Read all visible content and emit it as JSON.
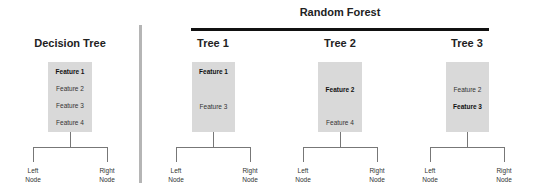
{
  "random_forest": {
    "title": "Random Forest"
  },
  "trees": [
    {
      "title": "Decision Tree",
      "features": [
        {
          "label": "Feature 1",
          "bold": true
        },
        {
          "label": "Feature 2",
          "bold": false
        },
        {
          "label": "Feature 3",
          "bold": false
        },
        {
          "label": "Feature 4",
          "bold": false
        }
      ],
      "left_node": [
        "Left",
        "Node"
      ],
      "right_node": [
        "Right",
        "Node"
      ]
    },
    {
      "title": "Tree 1",
      "features": [
        {
          "label": "Feature 1",
          "bold": true
        },
        {
          "label": "Feature 3",
          "bold": false
        }
      ],
      "left_node": [
        "Left",
        "Node"
      ],
      "right_node": [
        "Right",
        "Node"
      ]
    },
    {
      "title": "Tree 2",
      "features": [
        {
          "label": "Feature 2",
          "bold": true
        },
        {
          "label": "Feature 4",
          "bold": false
        }
      ],
      "left_node": [
        "Left",
        "Node"
      ],
      "right_node": [
        "Right",
        "Node"
      ]
    },
    {
      "title": "Tree 3",
      "features": [
        {
          "label": "Feature 2",
          "bold": false
        },
        {
          "label": "Feature 3",
          "bold": true
        }
      ],
      "left_node": [
        "Left",
        "Node"
      ],
      "right_node": [
        "Right",
        "Node"
      ]
    }
  ],
  "colors": {
    "box": "#d9d9d9",
    "separator": "#b5b5b5",
    "bar": "#111111",
    "branch": "#777777"
  }
}
